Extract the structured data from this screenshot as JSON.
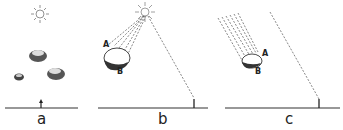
{
  "diagram": {
    "panels": [
      {
        "id": "a",
        "label": "a",
        "description": "Sun directly overhead, three rocks, upright shadow marker on ground"
      },
      {
        "id": "b",
        "label": "b",
        "description": "Nearby sun with diverging rays hitting rock, point A lit, point B shaded; ray to ground marker"
      },
      {
        "id": "c",
        "label": "c",
        "description": "Distant sun with parallel rays hitting rock, points A and B; parallel ray to ground marker"
      }
    ],
    "points": {
      "b_A": "A",
      "b_B": "B",
      "c_A": "A",
      "c_B": "B"
    },
    "colors": {
      "ink": "#222222",
      "background": "#ffffff"
    }
  }
}
